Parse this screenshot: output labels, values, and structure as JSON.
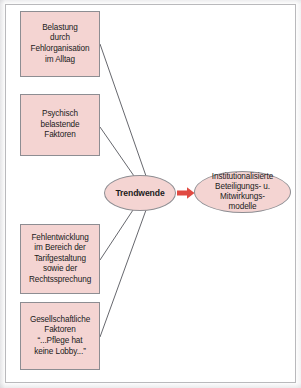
{
  "diagram": {
    "type": "flow-diagram",
    "title": "",
    "colors": {
      "node_fill": "#f4d4d2",
      "node_border": "#8d8d92",
      "connector": "#55565c",
      "arrow": "#e04a42",
      "text": "#1b1b1b",
      "frame_border": "#b9b9bc",
      "background": "#ffffff"
    },
    "factor_boxes": [
      {
        "id": "box-1",
        "label": "Belastung\ndurch\nFehlorganisation\nim Alltag"
      },
      {
        "id": "box-2",
        "label": "Psychisch\nbelastende\nFaktoren"
      },
      {
        "id": "box-3",
        "label": "Fehlentwicklung\nim Bereich der\nTarifgestaltung\nsowie der\nRechtssprechung"
      },
      {
        "id": "box-4",
        "label": "Gesellschaftliche\nFaktoren\n“...Pflege hat\nkeine Lobby...”"
      }
    ],
    "hub": {
      "id": "ellipse-trendwende",
      "label": "Trendwende"
    },
    "outcome": {
      "id": "ellipse-outcome",
      "label": "Institutionalisierte\nBeteiligungs- u.\nMitwirkungs-\nmodelle"
    },
    "arrow": {
      "name": "arrow-right-icon",
      "direction": "right",
      "color": "#e04a42"
    },
    "connectors": [
      {
        "from": "box-1",
        "to": "ellipse-trendwende"
      },
      {
        "from": "box-2",
        "to": "ellipse-trendwende"
      },
      {
        "from": "box-3",
        "to": "ellipse-trendwende"
      },
      {
        "from": "box-4",
        "to": "ellipse-trendwende"
      }
    ]
  }
}
